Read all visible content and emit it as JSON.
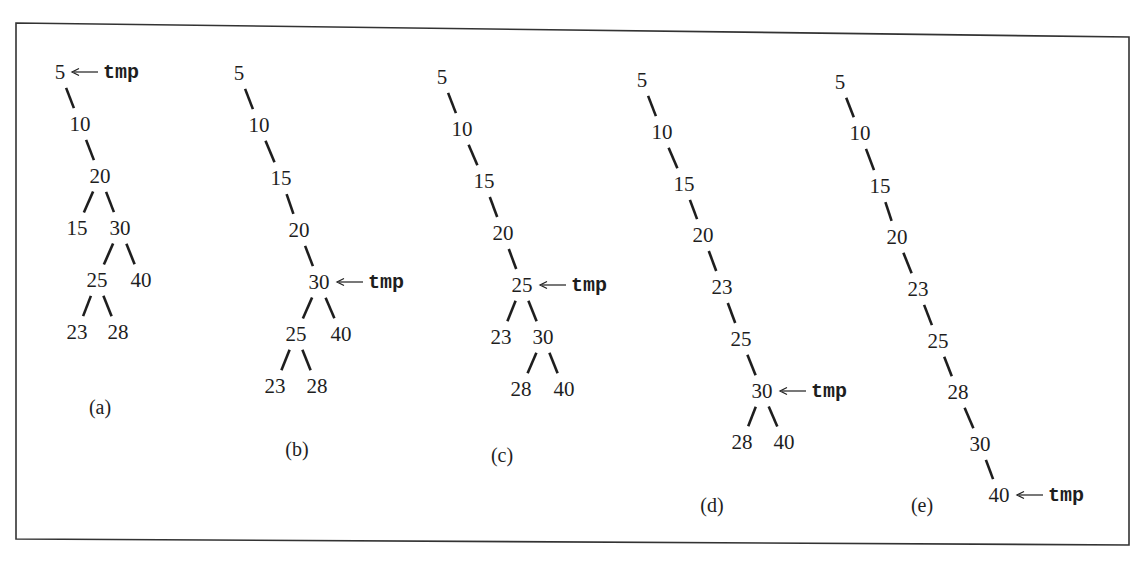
{
  "figure": {
    "pointer_label": "tmp",
    "panels": [
      {
        "id": "a",
        "caption": "(a)",
        "label_pos": [
          100,
          408
        ],
        "nodes": [
          {
            "v": "5",
            "x": 60,
            "y": 72
          },
          {
            "v": "10",
            "x": 80,
            "y": 124
          },
          {
            "v": "20",
            "x": 100,
            "y": 176
          },
          {
            "v": "15",
            "x": 77,
            "y": 228
          },
          {
            "v": "30",
            "x": 120,
            "y": 228
          },
          {
            "v": "25",
            "x": 97,
            "y": 280
          },
          {
            "v": "40",
            "x": 141,
            "y": 280
          },
          {
            "v": "23",
            "x": 77,
            "y": 332
          },
          {
            "v": "28",
            "x": 118,
            "y": 332
          }
        ],
        "edges": [
          [
            0,
            1
          ],
          [
            1,
            2
          ],
          [
            2,
            3
          ],
          [
            2,
            4
          ],
          [
            4,
            5
          ],
          [
            4,
            6
          ],
          [
            5,
            7
          ],
          [
            5,
            8
          ]
        ],
        "tmp_at": 0
      },
      {
        "id": "b",
        "caption": "(b)",
        "label_pos": [
          297,
          450
        ],
        "nodes": [
          {
            "v": "5",
            "x": 239,
            "y": 73
          },
          {
            "v": "10",
            "x": 259,
            "y": 125
          },
          {
            "v": "15",
            "x": 281,
            "y": 178
          },
          {
            "v": "20",
            "x": 299,
            "y": 230
          },
          {
            "v": "30",
            "x": 319,
            "y": 282
          },
          {
            "v": "25",
            "x": 296,
            "y": 334
          },
          {
            "v": "40",
            "x": 341,
            "y": 334
          },
          {
            "v": "23",
            "x": 275,
            "y": 386
          },
          {
            "v": "28",
            "x": 317,
            "y": 386
          }
        ],
        "edges": [
          [
            0,
            1
          ],
          [
            1,
            2
          ],
          [
            2,
            3
          ],
          [
            3,
            4
          ],
          [
            4,
            5
          ],
          [
            4,
            6
          ],
          [
            5,
            7
          ],
          [
            5,
            8
          ]
        ],
        "tmp_at": 4
      },
      {
        "id": "c",
        "caption": "(c)",
        "label_pos": [
          502,
          456
        ],
        "nodes": [
          {
            "v": "5",
            "x": 442,
            "y": 77
          },
          {
            "v": "10",
            "x": 462,
            "y": 129
          },
          {
            "v": "15",
            "x": 484,
            "y": 181
          },
          {
            "v": "20",
            "x": 503,
            "y": 233
          },
          {
            "v": "25",
            "x": 522,
            "y": 285
          },
          {
            "v": "23",
            "x": 501,
            "y": 337
          },
          {
            "v": "30",
            "x": 543,
            "y": 337
          },
          {
            "v": "28",
            "x": 521,
            "y": 389
          },
          {
            "v": "40",
            "x": 564,
            "y": 389
          }
        ],
        "edges": [
          [
            0,
            1
          ],
          [
            1,
            2
          ],
          [
            2,
            3
          ],
          [
            3,
            4
          ],
          [
            4,
            5
          ],
          [
            4,
            6
          ],
          [
            6,
            7
          ],
          [
            6,
            8
          ]
        ],
        "tmp_at": 4
      },
      {
        "id": "d",
        "caption": "(d)",
        "label_pos": [
          712,
          506
        ],
        "nodes": [
          {
            "v": "5",
            "x": 642,
            "y": 80
          },
          {
            "v": "10",
            "x": 662,
            "y": 132
          },
          {
            "v": "15",
            "x": 684,
            "y": 184
          },
          {
            "v": "20",
            "x": 703,
            "y": 235
          },
          {
            "v": "23",
            "x": 722,
            "y": 287
          },
          {
            "v": "25",
            "x": 741,
            "y": 339
          },
          {
            "v": "30",
            "x": 762,
            "y": 391
          },
          {
            "v": "28",
            "x": 742,
            "y": 442
          },
          {
            "v": "40",
            "x": 784,
            "y": 442
          }
        ],
        "edges": [
          [
            0,
            1
          ],
          [
            1,
            2
          ],
          [
            2,
            3
          ],
          [
            3,
            4
          ],
          [
            4,
            5
          ],
          [
            5,
            6
          ],
          [
            6,
            7
          ],
          [
            6,
            8
          ]
        ],
        "tmp_at": 6
      },
      {
        "id": "e",
        "caption": "(e)",
        "label_pos": [
          922,
          506
        ],
        "nodes": [
          {
            "v": "5",
            "x": 840,
            "y": 82
          },
          {
            "v": "10",
            "x": 860,
            "y": 133
          },
          {
            "v": "15",
            "x": 880,
            "y": 186
          },
          {
            "v": "20",
            "x": 897,
            "y": 237
          },
          {
            "v": "23",
            "x": 918,
            "y": 289
          },
          {
            "v": "25",
            "x": 938,
            "y": 341
          },
          {
            "v": "28",
            "x": 958,
            "y": 392
          },
          {
            "v": "30",
            "x": 980,
            "y": 444
          },
          {
            "v": "40",
            "x": 999,
            "y": 495
          }
        ],
        "edges": [
          [
            0,
            1
          ],
          [
            1,
            2
          ],
          [
            2,
            3
          ],
          [
            3,
            4
          ],
          [
            4,
            5
          ],
          [
            5,
            6
          ],
          [
            6,
            7
          ],
          [
            7,
            8
          ]
        ],
        "tmp_at": 8
      }
    ]
  }
}
